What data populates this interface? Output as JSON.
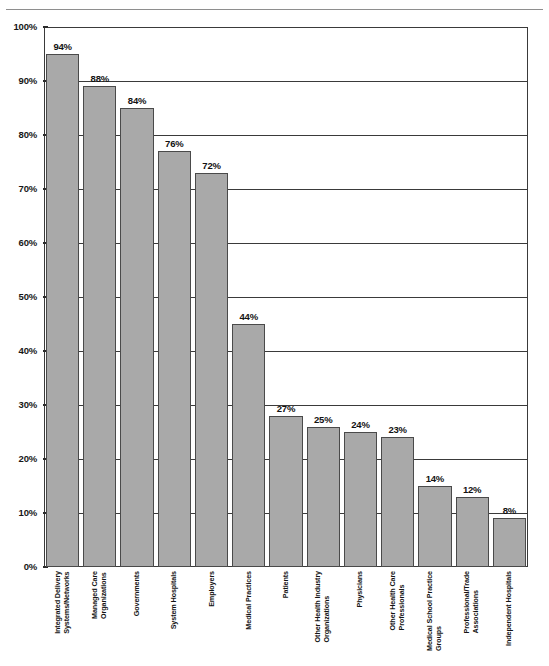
{
  "top_caption": "",
  "chart_data": {
    "type": "bar",
    "title": "",
    "subtitle": "",
    "xlabel": "",
    "ylabel": "",
    "ylim": [
      0,
      100
    ],
    "grid": true,
    "legend": "none",
    "orientation": "vertical",
    "value_suffix": "%",
    "y_ticks": [
      "0%",
      "10%",
      "20%",
      "30%",
      "40%",
      "50%",
      "60%",
      "70%",
      "80%",
      "90%",
      "100%"
    ],
    "y_tick_values": [
      0,
      10,
      20,
      30,
      40,
      50,
      60,
      70,
      80,
      90,
      100
    ],
    "bar_color": "#a9a9a9",
    "bar_border_color": "#4a4a4a",
    "axis_color": "#3a3a3a",
    "categories": [
      "Integrated Delivery Systems/Networks",
      "Managed Care Organizations",
      "Governments",
      "System Hospitals",
      "Employers",
      "Medical Practices",
      "Patients",
      "Other Health Industry Organizations",
      "Physicians",
      "Other Health Care Professionals",
      "Medical School Practice Groups",
      "Professional/Trade Associations",
      "Independent Hospitals"
    ],
    "category_lines": [
      [
        "Integrated Delivery",
        "Systems/Networks"
      ],
      [
        "Managed Care",
        "Organizations"
      ],
      [
        "Governments",
        ""
      ],
      [
        "System Hospitals",
        ""
      ],
      [
        "Employers",
        ""
      ],
      [
        "Medical Practices",
        ""
      ],
      [
        "Patients",
        ""
      ],
      [
        "Other Health Industry",
        "Organizations"
      ],
      [
        "Physicians",
        ""
      ],
      [
        "Other Health Care",
        "Professionals"
      ],
      [
        "Medical School Practice",
        "Groups"
      ],
      [
        "Professional/Trade",
        "Associations"
      ],
      [
        "Independent Hospitals",
        ""
      ]
    ],
    "values": [
      94,
      88,
      84,
      76,
      72,
      44,
      27,
      25,
      24,
      23,
      14,
      12,
      8
    ],
    "bar_draw_values": [
      95,
      89,
      85,
      77,
      73,
      45,
      28,
      26,
      25,
      24,
      15,
      13,
      9
    ],
    "value_labels": [
      "94%",
      "88%",
      "84%",
      "76%",
      "72%",
      "44%",
      "27%",
      "25%",
      "24%",
      "23%",
      "14%",
      "12%",
      "8%"
    ]
  }
}
